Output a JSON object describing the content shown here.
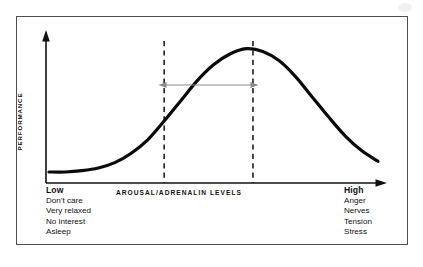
{
  "figure": {
    "frame_border_color": "#4d4d52",
    "background_color": "#ffffff"
  },
  "axes": {
    "y_label": "PERFORMANCE",
    "x_label": "AROUSAL/ADRENALIN LEVELS",
    "axis_color": "#111111"
  },
  "annotations": {
    "optimal_band_arrow": {
      "name": "optimal-zone-double-arrow",
      "color": "#8c8c8c",
      "left_x": 160,
      "right_x": 257,
      "y": 85
    },
    "dashed_lines": {
      "color": "#111111",
      "left_x": 160,
      "right_x": 257
    }
  },
  "scales": {
    "low": {
      "heading": "Low",
      "items": [
        "Don't care",
        "Very relaxed",
        "No interest",
        "Asleep"
      ]
    },
    "high": {
      "heading": "High",
      "items": [
        "Anger",
        "Nerves",
        "Tension",
        "Stress"
      ]
    }
  },
  "chart_data": {
    "type": "line",
    "xlabel": "AROUSAL/ADRENALIN LEVELS",
    "ylabel": "PERFORMANCE",
    "xlim": [
      0,
      100
    ],
    "ylim": [
      0,
      100
    ],
    "grid": false,
    "legend": null,
    "x_tick_labels": [
      "Low",
      "High"
    ],
    "y_tick_labels": [],
    "series": [
      {
        "name": "Performance",
        "line_color": "#0a0a0a",
        "line_width": 3.2,
        "x": [
          0,
          5,
          10,
          15,
          20,
          25,
          30,
          35,
          40,
          45,
          50,
          55,
          60,
          65,
          70,
          75,
          80,
          85,
          90,
          95,
          100
        ],
        "values": [
          3,
          3,
          4,
          6,
          10,
          17,
          27,
          41,
          56,
          71,
          83,
          91,
          95,
          93,
          86,
          74,
          59,
          44,
          30,
          19,
          11
        ]
      }
    ],
    "annotations": [
      {
        "type": "vline",
        "name": "lower-optimal-threshold",
        "x": 35,
        "style": "dashed",
        "color": "#111111"
      },
      {
        "type": "vline",
        "name": "upper-optimal-threshold",
        "x": 62,
        "style": "dashed",
        "color": "#111111"
      },
      {
        "type": "double-arrow",
        "name": "optimal-arousal-zone",
        "x_start": 35,
        "x_end": 62,
        "y": 70,
        "color": "#8c8c8c"
      }
    ]
  }
}
